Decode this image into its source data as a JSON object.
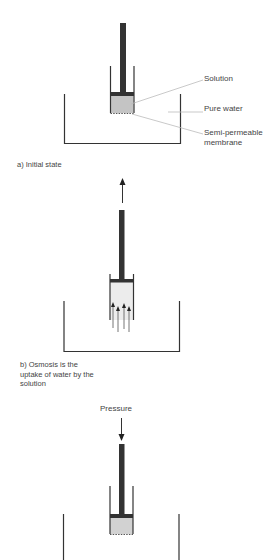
{
  "diagram": {
    "panels": [
      {
        "id": "a",
        "caption": "a) Initial state",
        "labels": {
          "solution": "Solution",
          "pure_water": "Pure water",
          "membrane_line1": "Semi-permeable",
          "membrane_line2": "membrane"
        }
      },
      {
        "id": "b",
        "caption_lines": [
          "b) Osmosis is the",
          "uptake of water by the",
          "solution"
        ]
      },
      {
        "id": "c",
        "pressure_label": "Pressure"
      }
    ],
    "colors": {
      "rod": "#333333",
      "wall": "#333333",
      "solution_fill_a": "#c4c4c4",
      "solution_fill_b": "#ececec",
      "solution_fill_c": "#d2d2d2",
      "leader_line": "#bbbbbb"
    }
  }
}
